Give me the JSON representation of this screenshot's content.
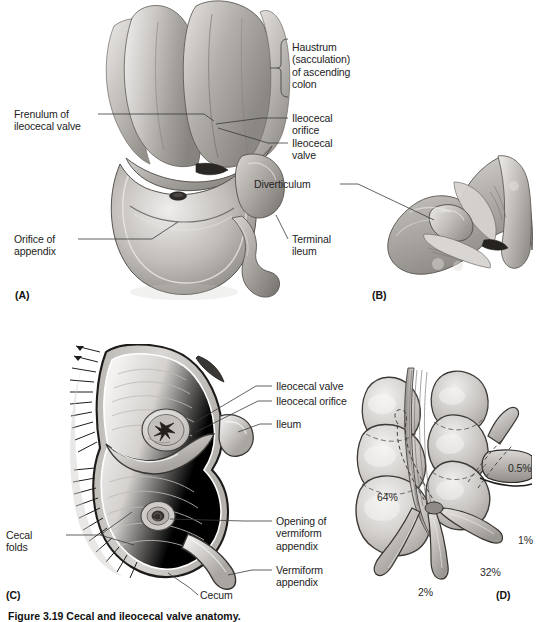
{
  "figure": {
    "caption": "Figure 3.19  Cecal and ileocecal valve anatomy.",
    "panels": [
      {
        "id": "A",
        "label": "(A)"
      },
      {
        "id": "B",
        "label": "(B)"
      },
      {
        "id": "C",
        "label": "(C)"
      },
      {
        "id": "D",
        "label": "(D)"
      }
    ]
  },
  "panel_a": {
    "id_label": "(A)",
    "labels": {
      "haustrum": "Haustrum\n(sacculation)\nof ascending\ncolon",
      "frenulum": "Frenulum of\nileocecal valve",
      "ileocecal_orifice": "Ileocecal\norifice",
      "ileocecal_valve": "Ileocecal\nvalve",
      "orifice_of_appendix": "Orifice of\nappendix",
      "terminal_ileum": "Terminal\nileum"
    }
  },
  "panel_b": {
    "id_label": "(B)",
    "labels": {
      "diverticulum": "Diverticulum"
    }
  },
  "panel_c": {
    "id_label": "(C)",
    "labels": {
      "ileocecal_valve": "Ileocecal valve",
      "ileocecal_orifice": "Ileocecal orifice",
      "ileum": "Ileum",
      "opening_of_vermiform_appendix": "Opening of\nvermiform\nappendix",
      "vermiform_appendix": "Vermiform\nappendix",
      "cecal_folds": "Cecal\nfolds",
      "cecum": "Cecum"
    }
  },
  "panel_d": {
    "id_label": "(D)",
    "title": "Appendix position frequencies",
    "percentages": [
      {
        "name": "retrocecal-subserosal",
        "value": "0.5%"
      },
      {
        "name": "preileal",
        "value": "1%"
      },
      {
        "name": "pelvic-descending",
        "value": "32%"
      },
      {
        "name": "paracecal",
        "value": "2%"
      },
      {
        "name": "retrocecal-retrocolic",
        "value": "64%"
      }
    ]
  },
  "colors": {
    "background": "#ffffff",
    "ink": "#232323",
    "leader": "#3b3b3b",
    "tissue_light": "#e6e4e2",
    "tissue_mid": "#bdbab7",
    "tissue_dark": "#8e8a86",
    "outline": "#2a2a2a"
  }
}
